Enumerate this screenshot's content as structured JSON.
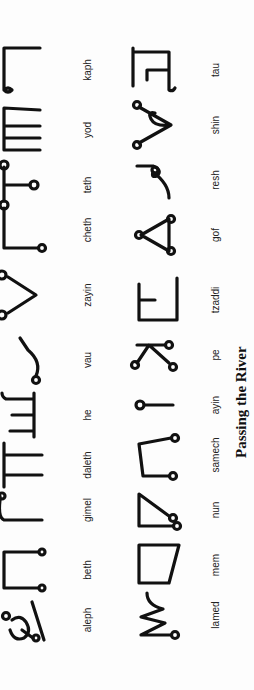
{
  "document": {
    "title": "Passing the River",
    "orientation": "rotated 90 degrees counter-clockwise",
    "rows": [
      {
        "letters": [
          {
            "name": "aleph",
            "glyph": "aleph-glyph"
          },
          {
            "name": "beth",
            "glyph": "beth-glyph"
          },
          {
            "name": "gimel",
            "glyph": "gimel-glyph"
          },
          {
            "name": "daleth",
            "glyph": "daleth-glyph"
          },
          {
            "name": "he",
            "glyph": "he-glyph"
          },
          {
            "name": "vau",
            "glyph": "vau-glyph"
          },
          {
            "name": "zayin",
            "glyph": "zayin-glyph"
          },
          {
            "name": "cheth",
            "glyph": "cheth-glyph"
          },
          {
            "name": "teth",
            "glyph": "teth-glyph"
          },
          {
            "name": "yod",
            "glyph": "yod-glyph"
          },
          {
            "name": "kaph",
            "glyph": "kaph-glyph"
          }
        ]
      },
      {
        "letters": [
          {
            "name": "lamed",
            "glyph": "lamed-glyph"
          },
          {
            "name": "mem",
            "glyph": "mem-glyph"
          },
          {
            "name": "nun",
            "glyph": "nun-glyph"
          },
          {
            "name": "samech",
            "glyph": "samech-glyph"
          },
          {
            "name": "ayin",
            "glyph": "ayin-glyph"
          },
          {
            "name": "pe",
            "glyph": "pe-glyph"
          },
          {
            "name": "tzaddi",
            "glyph": "tzaddi-glyph"
          },
          {
            "name": "gof",
            "glyph": "gof-glyph"
          },
          {
            "name": "resh",
            "glyph": "resh-glyph"
          },
          {
            "name": "shin",
            "glyph": "shin-glyph"
          },
          {
            "name": "tau",
            "glyph": "tau-glyph"
          }
        ]
      }
    ],
    "colors": {
      "ink": "#111111",
      "paper": "#fdfdfd"
    }
  }
}
